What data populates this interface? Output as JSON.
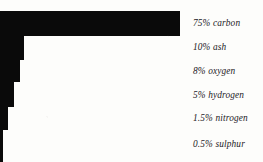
{
  "chart_data": {
    "type": "bar",
    "orientation": "horizontal",
    "title": "",
    "subtitle": "",
    "xlabel": "",
    "ylabel": "",
    "grid": false,
    "legend_position": "right",
    "axis_visible": false,
    "xlim": [
      0,
      75
    ],
    "categories": [
      "carbon",
      "ash",
      "oxygen",
      "hydrogen",
      "nitrogen",
      "sulphur"
    ],
    "values": [
      75,
      10,
      8,
      5,
      1.5,
      0.5
    ],
    "unit": "%",
    "labels": [
      "75% carbon",
      "10% ash",
      "8% oxygen",
      "5% hydrogen",
      "1.5% nitrogen",
      "0.5% sulphur"
    ],
    "bar_color": "#0a0a0a",
    "background_color": "#fdfdfb"
  },
  "bars": [
    {
      "name": "carbon",
      "label": "75% carbon",
      "value": 75,
      "top": 11,
      "height": 25,
      "width": 180
    },
    {
      "name": "ash",
      "label": "10% ash",
      "value": 10,
      "top": 36,
      "height": 24,
      "width": 24
    },
    {
      "name": "oxygen",
      "label": "8% oxygen",
      "value": 8,
      "top": 60,
      "height": 22,
      "width": 20
    },
    {
      "name": "hydrogen",
      "label": "5% hydrogen",
      "value": 5,
      "top": 82,
      "height": 25,
      "width": 14
    },
    {
      "name": "nitrogen",
      "label": "1.5% nitrogen",
      "value": 1.5,
      "top": 107,
      "height": 23,
      "width": 8
    },
    {
      "name": "sulphur",
      "label": "0.5% sulphur",
      "value": 0.5,
      "top": 130,
      "height": 32,
      "width": 3
    }
  ],
  "labels": [
    {
      "text": "75% carbon",
      "top": 18
    },
    {
      "text": "10% ash",
      "top": 42
    },
    {
      "text": "8% oxygen",
      "top": 66
    },
    {
      "text": "5% hydrogen",
      "top": 90
    },
    {
      "text": "1.5% nitrogen",
      "top": 113
    },
    {
      "text": "0.5% sulphur",
      "top": 139
    }
  ]
}
